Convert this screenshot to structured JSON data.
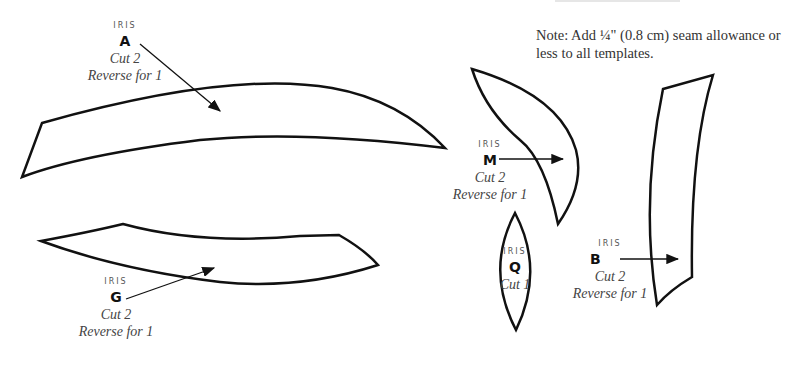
{
  "note": "Note: Add ¼\" (0.8 cm) seam allowance or less to all templates.",
  "templates": [
    {
      "source": "IRIS",
      "id": "A",
      "cut": "Cut 2",
      "reverse": "Reverse for 1"
    },
    {
      "source": "IRIS",
      "id": "G",
      "cut": "Cut 2",
      "reverse": "Reverse for 1"
    },
    {
      "source": "IRIS",
      "id": "M",
      "cut": "Cut 2",
      "reverse": "Reverse for 1"
    },
    {
      "source": "IRIS",
      "id": "Q",
      "cut": "Cut 1"
    },
    {
      "source": "IRIS",
      "id": "B",
      "cut": "Cut 2",
      "reverse": "Reverse for 1"
    }
  ],
  "colors": {
    "stroke": "#111111",
    "text": "#333333",
    "background": "#ffffff"
  }
}
